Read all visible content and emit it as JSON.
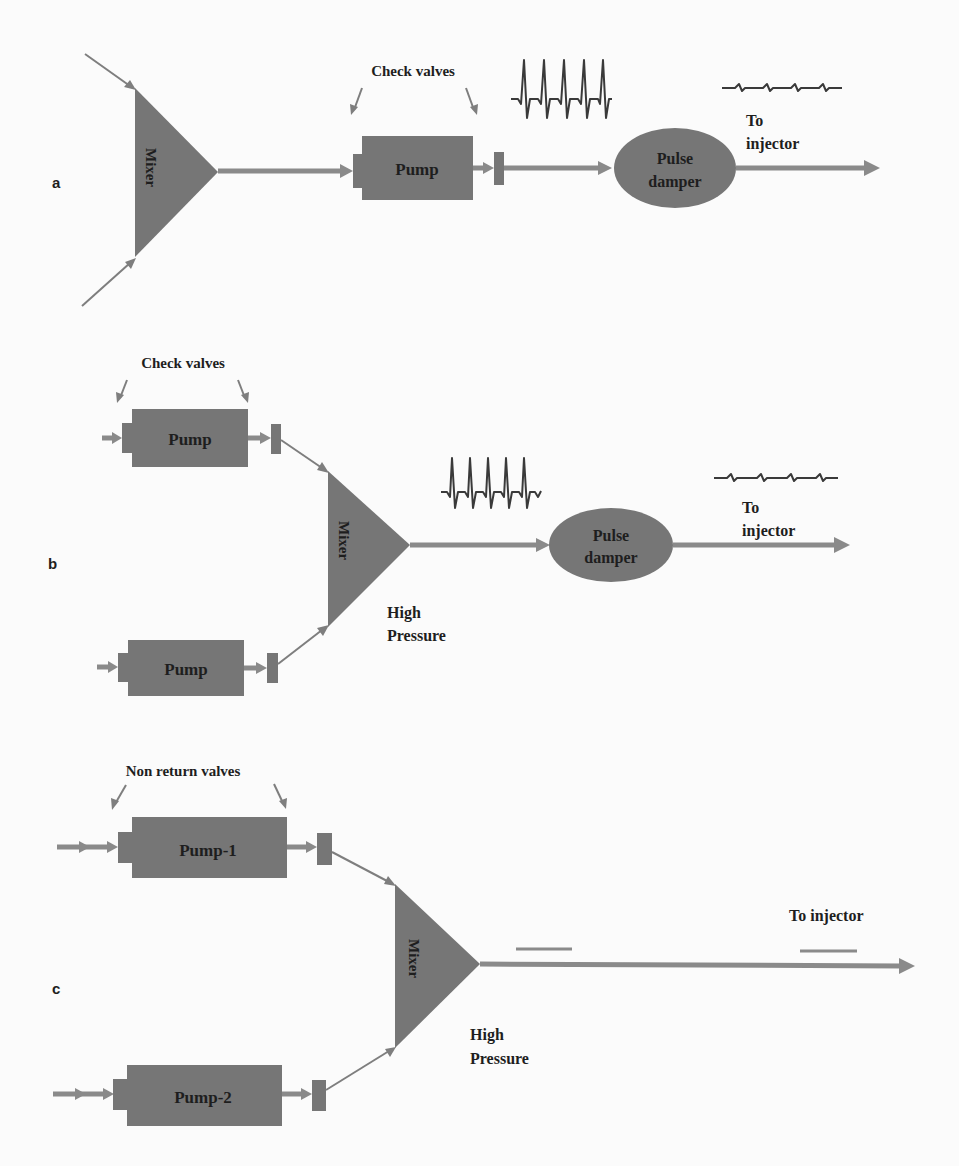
{
  "figure": {
    "panels": [
      {
        "id": "a",
        "label": "a",
        "mixer_label": "Mixer",
        "annotation": "Check valves",
        "pumps": [
          {
            "label": "Pump"
          }
        ],
        "pulse_damper_line1": "Pulse",
        "pulse_damper_line2": "damper",
        "output_line1": "To",
        "output_line2": "injector",
        "pre_damper_signal": "pulsating-flow-wave",
        "post_damper_signal": "damped-flow-wave"
      },
      {
        "id": "b",
        "label": "b",
        "mixer_label": "Mixer",
        "annotation": "Check valves",
        "pumps": [
          {
            "label": "Pump"
          },
          {
            "label": "Pump"
          }
        ],
        "pressure_line1": "High",
        "pressure_line2": "Pressure",
        "pulse_damper_line1": "Pulse",
        "pulse_damper_line2": "damper",
        "output_line1": "To",
        "output_line2": "injector",
        "pre_damper_signal": "pulsating-flow-wave",
        "post_damper_signal": "damped-flow-wave"
      },
      {
        "id": "c",
        "label": "c",
        "mixer_label": "Mixer",
        "annotation": "Non return  valves",
        "pumps": [
          {
            "label": "Pump-1"
          },
          {
            "label": "Pump-2"
          }
        ],
        "pressure_line1": "High",
        "pressure_line2": "Pressure",
        "output_label": "To injector",
        "pre_signal": "flat-flow-line",
        "post_signal": "flat-flow-line"
      }
    ],
    "colors": {
      "component_fill": "#767676",
      "flow_line": "#8a8a8a",
      "text": "#1e1e1e",
      "background": "#fbfbfb"
    }
  }
}
